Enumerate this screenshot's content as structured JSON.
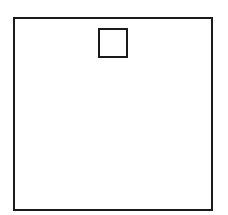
{
  "diagram": {
    "background": "#ffffff",
    "stroke_color": "#1a1a1a",
    "shapes": [
      {
        "name": "outer-square",
        "type": "rect",
        "x": 13,
        "y": 17,
        "width": 200,
        "height": 194,
        "stroke_width": 2
      },
      {
        "name": "inner-square",
        "type": "rect",
        "x": 98,
        "y": 28,
        "width": 30,
        "height": 30,
        "stroke_width": 2
      }
    ]
  }
}
